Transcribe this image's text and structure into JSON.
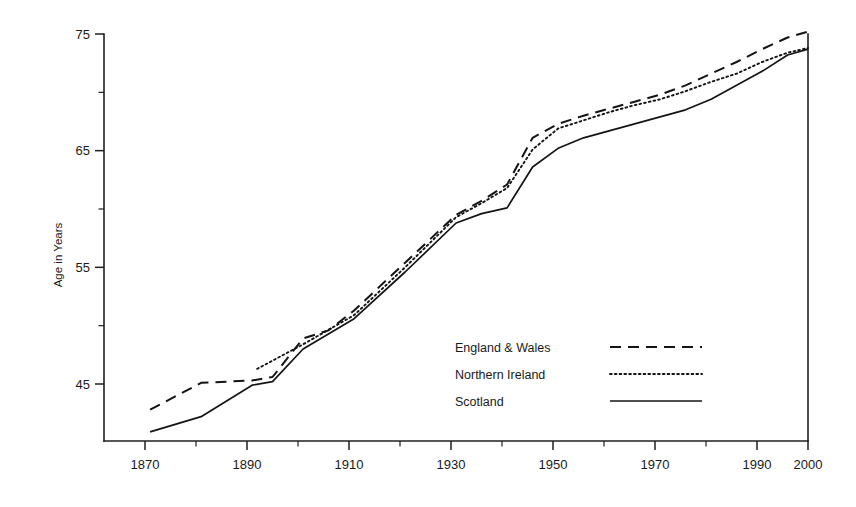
{
  "chart_data": {
    "type": "line",
    "title": "",
    "xlabel": "",
    "ylabel": "Age in Years",
    "xlim": [
      1865,
      2000
    ],
    "ylim": [
      40.5,
      76.5
    ],
    "grid": false,
    "legend_position": "center-right",
    "x_ticks_major": [
      1870,
      1890,
      1910,
      1930,
      1950,
      1970,
      1990,
      2000
    ],
    "x_ticks_minor": [
      1880,
      1900,
      1920,
      1940,
      1960,
      1980
    ],
    "y_ticks_major": [
      45,
      55,
      65,
      75
    ],
    "y_ticks_minor": [
      50,
      60,
      70
    ],
    "x_tick_labels": [
      "1870",
      "1890",
      "1910",
      "1930",
      "1950",
      "1970",
      "1990",
      "2000"
    ],
    "y_tick_labels": [
      "45",
      "55",
      "65",
      "75"
    ],
    "series": [
      {
        "name": "England & Wales",
        "style": "dashed",
        "x": [
          1871,
          1881,
          1891,
          1895,
          1901,
          1906,
          1911,
          1921,
          1931,
          1936,
          1941,
          1946,
          1951,
          1956,
          1961,
          1966,
          1971,
          1976,
          1981,
          1986,
          1991,
          1996,
          2000
        ],
        "values": [
          42.8,
          45.1,
          45.3,
          45.6,
          48.9,
          49.6,
          51.3,
          55.4,
          59.5,
          60.7,
          62.1,
          66.1,
          67.3,
          68.0,
          68.6,
          69.2,
          69.8,
          70.6,
          71.6,
          72.6,
          73.7,
          74.7,
          75.2
        ]
      },
      {
        "name": "Northern Ireland",
        "style": "dotted",
        "x": [
          1892,
          1901,
          1911,
          1921,
          1931,
          1936,
          1941,
          1946,
          1951,
          1956,
          1961,
          1966,
          1971,
          1976,
          1981,
          1986,
          1991,
          1996,
          2000
        ],
        "values": [
          46.3,
          48.4,
          50.9,
          55.0,
          59.3,
          60.5,
          61.8,
          65.1,
          66.9,
          67.6,
          68.3,
          68.9,
          69.4,
          70.1,
          70.9,
          71.6,
          72.6,
          73.4,
          73.8
        ]
      },
      {
        "name": "Scotland",
        "style": "solid",
        "x": [
          1871,
          1881,
          1891,
          1895,
          1901,
          1911,
          1921,
          1931,
          1936,
          1941,
          1946,
          1951,
          1956,
          1961,
          1966,
          1971,
          1976,
          1981,
          1986,
          1991,
          1996,
          2000
        ],
        "values": [
          40.9,
          42.2,
          44.9,
          45.2,
          48.0,
          50.6,
          54.6,
          58.8,
          59.6,
          60.1,
          63.6,
          65.2,
          66.1,
          66.7,
          67.3,
          67.9,
          68.5,
          69.4,
          70.6,
          71.8,
          73.2,
          73.7
        ]
      }
    ],
    "legend": [
      {
        "label": "England & Wales",
        "style": "dashed"
      },
      {
        "label": "Northern Ireland",
        "style": "dotted"
      },
      {
        "label": "Scotland",
        "style": "solid"
      }
    ],
    "colors": {
      "line": "#141414",
      "axis": "#1f1f1f",
      "background": "#ffffff",
      "text": "#1a1a1a"
    }
  }
}
